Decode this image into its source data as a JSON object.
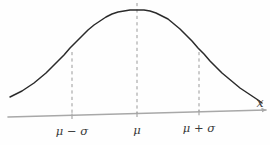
{
  "figure": {
    "title": "",
    "background_color": "#fefefe",
    "curve_color": "#2b2b2b",
    "axis_color": "#a8a8a8",
    "dash_color": "#9a9a9a",
    "label_color": "#3b3b3b"
  },
  "axis": {
    "x_label": "x",
    "arrow": "arrow-right"
  },
  "ticks": [
    {
      "id": "mu-minus-sigma",
      "label": "μ − σ",
      "x": 72
    },
    {
      "id": "mu",
      "label": "μ",
      "x": 137
    },
    {
      "id": "mu-plus-sigma",
      "label": "μ + σ",
      "x": 199
    }
  ],
  "chart_data": {
    "type": "line",
    "title": "",
    "xlabel": "x",
    "ylabel": "",
    "grid": false,
    "legend": null,
    "annotations": [
      {
        "text": "μ − σ",
        "at_x": 72,
        "kind": "tick-label"
      },
      {
        "text": "μ",
        "at_x": 137,
        "kind": "tick-label"
      },
      {
        "text": "μ + σ",
        "at_x": 199,
        "kind": "tick-label"
      },
      {
        "text": "x",
        "at_x": 263,
        "kind": "axis-label"
      }
    ],
    "mean_px": 137,
    "sigma_px": 63,
    "peak_px": {
      "x": 137,
      "y": 10
    },
    "baseline_px": {
      "x1": 8,
      "y1": 117,
      "x2": 264,
      "y2": 110
    },
    "series": [
      {
        "name": "normal-density",
        "points": [
          [
            10,
            97
          ],
          [
            16,
            94
          ],
          [
            22,
            91
          ],
          [
            28,
            87
          ],
          [
            34,
            83
          ],
          [
            40,
            78
          ],
          [
            46,
            73
          ],
          [
            52,
            67
          ],
          [
            58,
            61
          ],
          [
            64,
            55
          ],
          [
            70,
            48
          ],
          [
            76,
            42
          ],
          [
            82,
            36
          ],
          [
            88,
            30
          ],
          [
            94,
            25
          ],
          [
            100,
            21
          ],
          [
            106,
            17
          ],
          [
            112,
            14
          ],
          [
            118,
            12
          ],
          [
            124,
            11
          ],
          [
            130,
            10
          ],
          [
            137,
            10
          ],
          [
            144,
            10
          ],
          [
            150,
            11
          ],
          [
            156,
            13
          ],
          [
            162,
            16
          ],
          [
            168,
            19
          ],
          [
            174,
            24
          ],
          [
            180,
            29
          ],
          [
            186,
            35
          ],
          [
            192,
            41
          ],
          [
            198,
            48
          ],
          [
            204,
            54
          ],
          [
            210,
            61
          ],
          [
            216,
            67
          ],
          [
            222,
            73
          ],
          [
            228,
            78
          ],
          [
            234,
            83
          ],
          [
            240,
            88
          ],
          [
            246,
            92
          ],
          [
            252,
            96
          ],
          [
            258,
            100
          ],
          [
            262,
            103
          ]
        ]
      }
    ]
  }
}
